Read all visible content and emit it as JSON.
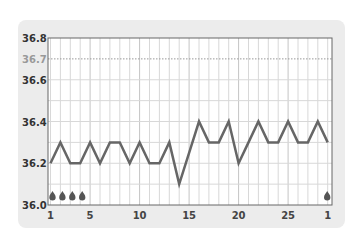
{
  "chart_data": {
    "type": "line",
    "title": "",
    "xlabel": "",
    "ylabel": "",
    "ylim": [
      36.0,
      36.8
    ],
    "yticks": [
      "36.0",
      "36.2",
      "36.4",
      "36.6",
      "36.7",
      "36.8"
    ],
    "xtick_labels": [
      {
        "day": 1,
        "label": "1"
      },
      {
        "day": 5,
        "label": "5"
      },
      {
        "day": 10,
        "label": "10"
      },
      {
        "day": 15,
        "label": "15"
      },
      {
        "day": 20,
        "label": "20"
      },
      {
        "day": 25,
        "label": "25"
      },
      {
        "day": 29,
        "label": "1"
      }
    ],
    "reference_line": {
      "value": 36.7,
      "style": "dotted"
    },
    "x": [
      1,
      2,
      3,
      4,
      5,
      6,
      7,
      8,
      9,
      10,
      11,
      12,
      13,
      14,
      15,
      16,
      17,
      18,
      19,
      20,
      21,
      22,
      23,
      24,
      25,
      26,
      27,
      28,
      29
    ],
    "series": [
      {
        "name": "Basal body temperature",
        "values": [
          36.2,
          36.3,
          36.2,
          36.2,
          36.3,
          36.2,
          36.3,
          36.3,
          36.2,
          36.3,
          36.2,
          36.2,
          36.3,
          36.1,
          36.25,
          36.4,
          36.3,
          36.3,
          36.4,
          36.2,
          36.3,
          36.4,
          36.3,
          36.3,
          36.4,
          36.3,
          36.3,
          36.4,
          36.3
        ]
      }
    ],
    "markers": {
      "type": "drop-icon",
      "days": [
        1,
        2,
        3,
        4,
        29
      ]
    },
    "grid": true,
    "colors": {
      "line": "#666666",
      "grid": "#d8d8d8",
      "card": "#ececec",
      "plot": "#ffffff"
    }
  }
}
